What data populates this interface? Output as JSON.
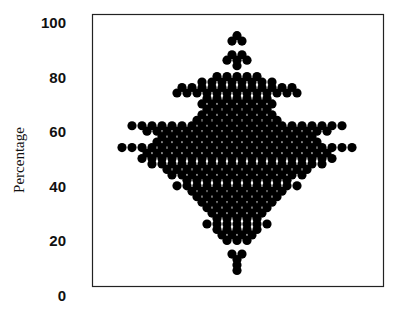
{
  "chart_data": {
    "type": "scatter",
    "subtype": "beeswarm",
    "title": "",
    "xlabel": "",
    "ylabel": "Percentage",
    "ylim": [
      0,
      100
    ],
    "yticks": [
      0,
      20,
      40,
      60,
      80,
      100
    ],
    "ytick_labels": [
      "0",
      "20",
      "40",
      "60",
      "80",
      "100"
    ],
    "grid": false,
    "legend": null,
    "marker_color": "#000000",
    "rows": [
      {
        "value": 95,
        "count": 1
      },
      {
        "value": 93,
        "count": 2
      },
      {
        "value": 88,
        "count": 2
      },
      {
        "value": 86,
        "count": 3
      },
      {
        "value": 84,
        "count": 1
      },
      {
        "value": 80,
        "count": 5
      },
      {
        "value": 78,
        "count": 8
      },
      {
        "value": 76,
        "count": 12
      },
      {
        "value": 74,
        "count": 13
      },
      {
        "value": 72,
        "count": 7
      },
      {
        "value": 70,
        "count": 8
      },
      {
        "value": 68,
        "count": 7
      },
      {
        "value": 66,
        "count": 8
      },
      {
        "value": 64,
        "count": 9
      },
      {
        "value": 62,
        "count": 22
      },
      {
        "value": 60,
        "count": 19
      },
      {
        "value": 58,
        "count": 16
      },
      {
        "value": 56,
        "count": 17
      },
      {
        "value": 54,
        "count": 24
      },
      {
        "value": 52,
        "count": 19
      },
      {
        "value": 50,
        "count": 20
      },
      {
        "value": 48,
        "count": 18
      },
      {
        "value": 46,
        "count": 15
      },
      {
        "value": 44,
        "count": 14
      },
      {
        "value": 42,
        "count": 11
      },
      {
        "value": 40,
        "count": 13
      },
      {
        "value": 38,
        "count": 10
      },
      {
        "value": 36,
        "count": 9
      },
      {
        "value": 34,
        "count": 8
      },
      {
        "value": 32,
        "count": 7
      },
      {
        "value": 30,
        "count": 6
      },
      {
        "value": 28,
        "count": 5
      },
      {
        "value": 26,
        "count": 7
      },
      {
        "value": 24,
        "count": 5
      },
      {
        "value": 22,
        "count": 4
      },
      {
        "value": 20,
        "count": 3
      },
      {
        "value": 15,
        "count": 2
      },
      {
        "value": 13,
        "count": 1
      },
      {
        "value": 11,
        "count": 1
      },
      {
        "value": 9,
        "count": 1
      }
    ]
  }
}
